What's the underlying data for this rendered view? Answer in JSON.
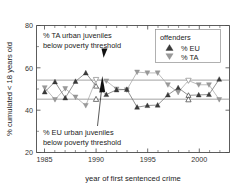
{
  "chart_data": {
    "type": "line",
    "title": "",
    "xlabel": "year of first sentenced crime",
    "ylabel": "% cumulated < 18 years old",
    "xlim": [
      1984.2,
      2003.0
    ],
    "ylim": [
      20,
      80
    ],
    "xticks": [
      1985,
      1990,
      1995,
      2000
    ],
    "yticks": [
      20,
      40,
      60,
      80
    ],
    "grid": false,
    "legend": {
      "title": "offenders",
      "position": "top-right",
      "entries": [
        {
          "label": "% EU",
          "marker": "triangle-up",
          "color": "#3b3b3b"
        },
        {
          "label": "% TA",
          "marker": "triangle-down",
          "color": "#9a9a9a"
        }
      ]
    },
    "x": [
      1985,
      1986,
      1987,
      1988,
      1989,
      1990,
      1991,
      1992,
      1993,
      1994,
      1995,
      1996,
      1997,
      1998,
      1999,
      2000,
      2001,
      2002
    ],
    "series": [
      {
        "name": "% EU",
        "marker": "triangle-up",
        "color": "#3b3b3b",
        "values": [
          48.6,
          53.4,
          45.8,
          53.6,
          57.6,
          51.4,
          47.4,
          49.6,
          49.8,
          41.4,
          42.2,
          42.4,
          47.2,
          50.6,
          47.0,
          47.2,
          47.4,
          54.6
        ]
      },
      {
        "name": "% TA",
        "marker": "triangle-down",
        "color": "#9a9a9a",
        "values": [
          50.6,
          45.0,
          50.2,
          46.2,
          42.2,
          54.4,
          53.8,
          50.0,
          49.6,
          58.0,
          57.6,
          57.6,
          52.0,
          48.4,
          54.0,
          52.0,
          52.0,
          45.0
        ]
      }
    ],
    "highlighted_points": [
      {
        "series": "% TA",
        "x": 1990,
        "y": 54.4,
        "style": "open"
      },
      {
        "series": "% EU",
        "x": 1990,
        "y": 45.2,
        "style": "open"
      },
      {
        "series": "% TA",
        "x": 1999,
        "y": 54.0,
        "style": "open"
      },
      {
        "series": "% EU",
        "x": 1999,
        "y": 45.0,
        "style": "open"
      }
    ],
    "reference_lines": [
      {
        "label": "% TA urban juveniles below poverty threshold",
        "y": 54.2
      },
      {
        "label": "% EU urban juveniles below poverty threshold",
        "y": 45.2
      }
    ],
    "annotations": [
      {
        "text_line1": "% TA urban juveniles",
        "text_line2": "below poverty threshold",
        "points_to": "ta-reference-line"
      },
      {
        "text_line1": "% EU urban juveniles",
        "text_line2": "below poverty threshold",
        "points_to": "eu-reference-line"
      }
    ]
  }
}
